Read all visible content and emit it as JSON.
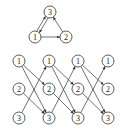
{
  "diagram": {
    "type": "directed-graph",
    "colors": {
      "stroke": "#333333",
      "background": "#ffffff",
      "text": "#222222"
    },
    "node_radius": 6,
    "top_graph": {
      "nodes": [
        {
          "id": "t3",
          "label": "3",
          "x": 50,
          "y": 12
        },
        {
          "id": "t1",
          "label": "1",
          "x": 35,
          "y": 37
        },
        {
          "id": "t2",
          "label": "2",
          "x": 66,
          "y": 37
        }
      ],
      "edges": [
        {
          "from": "t1",
          "to": "t3",
          "offset": -1.5
        },
        {
          "from": "t3",
          "to": "t1",
          "offset": -1.5
        },
        {
          "from": "t1",
          "to": "t2",
          "offset": 0
        },
        {
          "from": "t2",
          "to": "t3",
          "offset": 0
        }
      ]
    },
    "unrolled_graph": {
      "columns": [
        19,
        49,
        78,
        108
      ],
      "rows": [
        {
          "label": "1",
          "y": 61
        },
        {
          "label": "2",
          "y": 89
        },
        {
          "label": "3",
          "y": 118
        }
      ],
      "transition_edges": [
        {
          "from_row": 0,
          "to_row": 1
        },
        {
          "from_row": 0,
          "to_row": 2
        },
        {
          "from_row": 1,
          "to_row": 2
        },
        {
          "from_row": 2,
          "to_row": 0
        }
      ]
    }
  }
}
